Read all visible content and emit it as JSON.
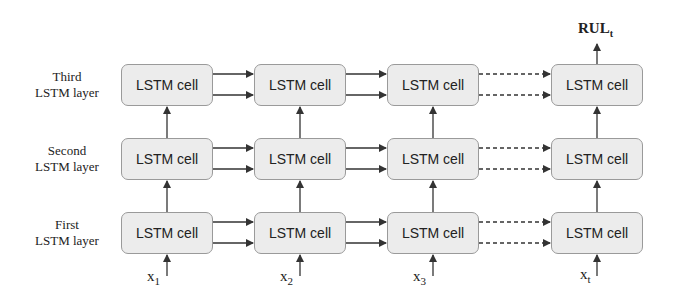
{
  "diagram": {
    "type": "stacked LSTM unrolled over time",
    "layers": [
      {
        "label_line1": "Third",
        "label_line2": "LSTM layer"
      },
      {
        "label_line1": "Second",
        "label_line2": "LSTM layer"
      },
      {
        "label_line1": "First",
        "label_line2": "LSTM layer"
      }
    ],
    "cell_label": "LSTM cell",
    "timesteps": [
      {
        "input_base": "x",
        "input_sub": "1"
      },
      {
        "input_base": "x",
        "input_sub": "2"
      },
      {
        "input_base": "x",
        "input_sub": "3"
      },
      {
        "input_base": "x",
        "input_sub": "t"
      }
    ],
    "output": {
      "base": "RUL",
      "sub": "t"
    },
    "connections": {
      "horizontal_per_pair": 2,
      "solid_between": [
        "1-2",
        "2-3"
      ],
      "dashed_between": [
        "3-t"
      ]
    },
    "colors": {
      "cell_fill": "#ececec",
      "cell_border": "#9a9a9a",
      "arrow": "#333333"
    }
  }
}
